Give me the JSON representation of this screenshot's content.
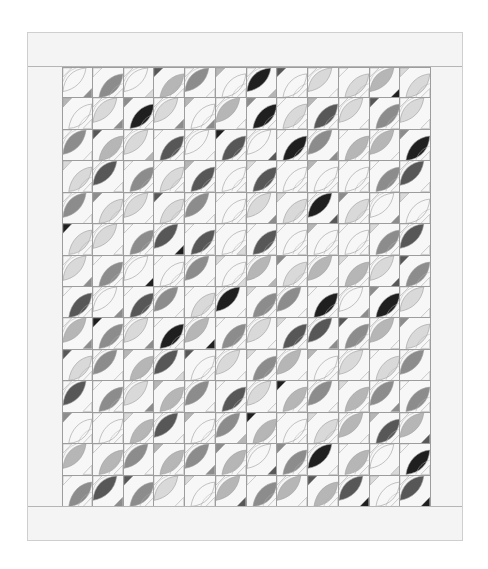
{
  "quilt": {
    "columns": 12,
    "rows": 14,
    "palette": {
      "0": "none",
      "1": "#d9d9d9",
      "2": "#b6b6b6",
      "3": "#8c8c8c",
      "4": "#575757",
      "5": "#1f1f1f"
    },
    "background": "#f7f7f7",
    "border_color": "#f4f4f4",
    "line_color": "#9d9d9d",
    "blocks": [
      [
        [
          0,
          "U",
          0,
          3
        ],
        [
          0,
          "D",
          3,
          0
        ],
        [
          0,
          "U",
          0,
          1
        ],
        [
          4,
          "D",
          2,
          0
        ],
        [
          0,
          "U",
          3,
          0
        ],
        [
          2,
          "D",
          0,
          0
        ],
        [
          0,
          "U",
          5,
          2
        ],
        [
          4,
          "D",
          0,
          0
        ],
        [
          0,
          "U",
          1,
          0
        ],
        [
          0,
          "D",
          1,
          0
        ],
        [
          0,
          "U",
          2,
          5
        ],
        [
          1,
          "D",
          1,
          0
        ]
      ],
      [
        [
          2,
          "D",
          0,
          0
        ],
        [
          0,
          "U",
          1,
          3
        ],
        [
          3,
          "D",
          5,
          0
        ],
        [
          0,
          "U",
          1,
          3
        ],
        [
          2,
          "D",
          0,
          3
        ],
        [
          0,
          "U",
          2,
          0
        ],
        [
          3,
          "D",
          5,
          0
        ],
        [
          0,
          "D",
          1,
          0
        ],
        [
          2,
          "D",
          4,
          0
        ],
        [
          0,
          "U",
          1,
          0
        ],
        [
          4,
          "D",
          3,
          0
        ],
        [
          0,
          "U",
          1,
          0
        ]
      ],
      [
        [
          0,
          "U",
          3,
          0
        ],
        [
          4,
          "D",
          2,
          0
        ],
        [
          0,
          "U",
          1,
          2
        ],
        [
          0,
          "D",
          4,
          0
        ],
        [
          0,
          "U",
          0,
          0
        ],
        [
          5,
          "D",
          4,
          0
        ],
        [
          0,
          "U",
          0,
          4
        ],
        [
          0,
          "D",
          5,
          0
        ],
        [
          0,
          "U",
          3,
          3
        ],
        [
          0,
          "D",
          2,
          0
        ],
        [
          0,
          "U",
          2,
          0
        ],
        [
          3,
          "D",
          5,
          0
        ]
      ],
      [
        [
          1,
          "D",
          1,
          0
        ],
        [
          0,
          "U",
          4,
          0
        ],
        [
          0,
          "D",
          3,
          0
        ],
        [
          0,
          "D",
          1,
          0
        ],
        [
          2,
          "D",
          4,
          0
        ],
        [
          0,
          "D",
          0,
          0
        ],
        [
          1,
          "D",
          4,
          0
        ],
        [
          0,
          "D",
          0,
          0
        ],
        [
          2,
          "D",
          0,
          0
        ],
        [
          0,
          "D",
          0,
          0
        ],
        [
          0,
          "D",
          3,
          0
        ],
        [
          0,
          "U",
          4,
          0
        ]
      ],
      [
        [
          0,
          "U",
          3,
          0
        ],
        [
          3,
          "D",
          1,
          0
        ],
        [
          0,
          "U",
          1,
          0
        ],
        [
          4,
          "D",
          1,
          0
        ],
        [
          0,
          "U",
          3,
          0
        ],
        [
          0,
          "D",
          0,
          0
        ],
        [
          0,
          "U",
          1,
          3
        ],
        [
          1,
          "D",
          1,
          0
        ],
        [
          0,
          "U",
          5,
          4
        ],
        [
          3,
          "D",
          1,
          0
        ],
        [
          0,
          "U",
          0,
          3
        ],
        [
          1,
          "D",
          0,
          0
        ]
      ],
      [
        [
          5,
          "D",
          1,
          0
        ],
        [
          0,
          "U",
          1,
          0
        ],
        [
          0,
          "D",
          3,
          0
        ],
        [
          0,
          "U",
          4,
          5
        ],
        [
          0,
          "D",
          4,
          0
        ],
        [
          0,
          "D",
          0,
          1
        ],
        [
          0,
          "D",
          4,
          0
        ],
        [
          0,
          "D",
          0,
          0
        ],
        [
          2,
          "D",
          0,
          0
        ],
        [
          0,
          "D",
          0,
          0
        ],
        [
          1,
          "D",
          3,
          0
        ],
        [
          0,
          "U",
          4,
          0
        ]
      ],
      [
        [
          0,
          "U",
          1,
          3
        ],
        [
          0,
          "D",
          3,
          0
        ],
        [
          0,
          "U",
          0,
          5
        ],
        [
          0,
          "D",
          0,
          0
        ],
        [
          0,
          "U",
          3,
          0
        ],
        [
          1,
          "D",
          0,
          1
        ],
        [
          0,
          "U",
          2,
          2
        ],
        [
          3,
          "D",
          1,
          0
        ],
        [
          0,
          "U",
          2,
          0
        ],
        [
          1,
          "D",
          2,
          0
        ],
        [
          0,
          "U",
          1,
          4
        ],
        [
          4,
          "D",
          3,
          0
        ]
      ],
      [
        [
          0,
          "D",
          4,
          0
        ],
        [
          0,
          "U",
          0,
          3
        ],
        [
          0,
          "D",
          4,
          0
        ],
        [
          0,
          "U",
          3,
          0
        ],
        [
          0,
          "D",
          1,
          0
        ],
        [
          0,
          "U",
          5,
          0
        ],
        [
          1,
          "D",
          3,
          0
        ],
        [
          0,
          "U",
          3,
          0
        ],
        [
          0,
          "D",
          5,
          0
        ],
        [
          0,
          "U",
          0,
          3
        ],
        [
          3,
          "D",
          5,
          0
        ],
        [
          0,
          "U",
          1,
          0
        ]
      ],
      [
        [
          0,
          "U",
          2,
          3
        ],
        [
          5,
          "D",
          3,
          0
        ],
        [
          0,
          "U",
          1,
          3
        ],
        [
          0,
          "D",
          5,
          0
        ],
        [
          0,
          "U",
          2,
          5
        ],
        [
          0,
          "D",
          3,
          0
        ],
        [
          0,
          "U",
          1,
          0
        ],
        [
          1,
          "D",
          4,
          0
        ],
        [
          0,
          "U",
          4,
          3
        ],
        [
          4,
          "D",
          3,
          0
        ],
        [
          0,
          "U",
          2,
          0
        ],
        [
          3,
          "D",
          1,
          0
        ]
      ],
      [
        [
          4,
          "D",
          1,
          0
        ],
        [
          0,
          "U",
          3,
          0
        ],
        [
          2,
          "D",
          2,
          0
        ],
        [
          0,
          "U",
          4,
          1
        ],
        [
          4,
          "D",
          0,
          0
        ],
        [
          0,
          "U",
          1,
          0
        ],
        [
          1,
          "D",
          3,
          0
        ],
        [
          0,
          "U",
          2,
          0
        ],
        [
          2,
          "D",
          0,
          0
        ],
        [
          0,
          "U",
          1,
          0
        ],
        [
          0,
          "D",
          1,
          0
        ],
        [
          0,
          "U",
          3,
          0
        ]
      ],
      [
        [
          0,
          "U",
          4,
          0
        ],
        [
          0,
          "D",
          3,
          0
        ],
        [
          0,
          "U",
          1,
          3
        ],
        [
          2,
          "D",
          2,
          0
        ],
        [
          0,
          "U",
          3,
          0
        ],
        [
          0,
          "D",
          4,
          0
        ],
        [
          0,
          "U",
          1,
          0
        ],
        [
          5,
          "D",
          2,
          0
        ],
        [
          0,
          "U",
          3,
          0
        ],
        [
          1,
          "D",
          2,
          0
        ],
        [
          0,
          "U",
          3,
          3
        ],
        [
          0,
          "D",
          3,
          0
        ]
      ],
      [
        [
          3,
          "D",
          0,
          0
        ],
        [
          0,
          "D",
          0,
          0
        ],
        [
          1,
          "D",
          2,
          0
        ],
        [
          0,
          "U",
          4,
          0
        ],
        [
          2,
          "D",
          0,
          0
        ],
        [
          0,
          "U",
          3,
          2
        ],
        [
          5,
          "D",
          2,
          0
        ],
        [
          0,
          "D",
          0,
          0
        ],
        [
          1,
          "D",
          1,
          0
        ],
        [
          0,
          "U",
          2,
          0
        ],
        [
          2,
          "D",
          4,
          0
        ],
        [
          0,
          "U",
          2,
          4
        ]
      ],
      [
        [
          0,
          "U",
          2,
          0
        ],
        [
          0,
          "D",
          2,
          0
        ],
        [
          0,
          "U",
          3,
          0
        ],
        [
          2,
          "D",
          2,
          0
        ],
        [
          0,
          "U",
          3,
          3
        ],
        [
          3,
          "D",
          2,
          0
        ],
        [
          0,
          "U",
          0,
          4
        ],
        [
          3,
          "D",
          3,
          0
        ],
        [
          0,
          "U",
          5,
          0
        ],
        [
          0,
          "D",
          2,
          0
        ],
        [
          0,
          "U",
          0,
          1
        ],
        [
          0,
          "D",
          5,
          0
        ]
      ],
      [
        [
          0,
          "D",
          3,
          0
        ],
        [
          0,
          "U",
          4,
          3
        ],
        [
          4,
          "D",
          3,
          0
        ],
        [
          0,
          "U",
          1,
          0
        ],
        [
          1,
          "D",
          0,
          0
        ],
        [
          0,
          "U",
          2,
          4
        ],
        [
          0,
          "D",
          3,
          0
        ],
        [
          0,
          "U",
          2,
          0
        ],
        [
          4,
          "D",
          2,
          0
        ],
        [
          0,
          "U",
          4,
          5
        ],
        [
          1,
          "D",
          0,
          0
        ],
        [
          0,
          "U",
          4,
          5
        ]
      ]
    ]
  }
}
